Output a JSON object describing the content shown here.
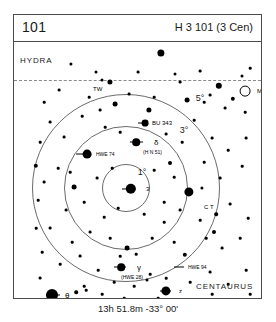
{
  "header": {
    "number": "101",
    "designation": "H 3 101 (3 Cen)"
  },
  "caption": "13h 51.8m  -33° 00'",
  "constellations": [
    {
      "name": "HYDRA",
      "x": 6,
      "y": 14
    },
    {
      "name": "CENTAURUS",
      "x": 182,
      "y": 240
    }
  ],
  "rings": [
    {
      "label": "5°",
      "radius": 94,
      "label_x": 186,
      "label_y": 56
    },
    {
      "label": "3°",
      "radius": 62,
      "label_x": 170,
      "label_y": 88
    },
    {
      "label": "1°",
      "radius": 24,
      "label_x": 128,
      "label_y": 130
    }
  ],
  "ring_center": {
    "x": 112,
    "y": 146
  },
  "labels": [
    {
      "text": "TW",
      "x": 79,
      "y": 47,
      "style": "obj-label"
    },
    {
      "text": "M83",
      "x": 243,
      "y": 49,
      "style": "obj-label"
    },
    {
      "text": "BU 343",
      "x": 138,
      "y": 81,
      "style": "obj-label"
    },
    {
      "text": "δ",
      "x": 140,
      "y": 100,
      "style": "obj-label greek"
    },
    {
      "text": "(H N 51)",
      "x": 129,
      "y": 110,
      "style": "obj-label sub"
    },
    {
      "text": "HWE 74",
      "x": 82,
      "y": 112,
      "style": "obj-label sub"
    },
    {
      "text": "3",
      "x": 132,
      "y": 147,
      "style": "obj-label"
    },
    {
      "text": "C T",
      "x": 190,
      "y": 165,
      "style": "obj-label"
    },
    {
      "text": "γ",
      "x": 123,
      "y": 225,
      "style": "obj-label greek"
    },
    {
      "text": "(HWE 28)",
      "x": 107,
      "y": 235,
      "style": "obj-label sub"
    },
    {
      "text": "HWE 94",
      "x": 174,
      "y": 225,
      "style": "obj-label sub"
    },
    {
      "text": "z",
      "x": 165,
      "y": 249,
      "style": "obj-label"
    },
    {
      "text": "θ",
      "x": 51,
      "y": 253,
      "style": "obj-label greek"
    },
    {
      "text": "RT",
      "x": 125,
      "y": 262,
      "style": "obj-label sub"
    }
  ],
  "ticks": [
    {
      "x": 108,
      "y": 147,
      "w": 14
    },
    {
      "x": 116,
      "y": 100,
      "w": 13
    },
    {
      "x": 62,
      "y": 112,
      "w": 11
    },
    {
      "x": 100,
      "y": 225,
      "w": 12
    },
    {
      "x": 160,
      "y": 225,
      "w": 10
    },
    {
      "x": 146,
      "y": 249,
      "w": 11
    },
    {
      "x": 32,
      "y": 253,
      "w": 14
    },
    {
      "x": 115,
      "y": 262,
      "w": 6
    },
    {
      "x": 124,
      "y": 81,
      "w": 8
    }
  ],
  "stars": [
    {
      "x": 117,
      "y": 147,
      "r": 5.2
    },
    {
      "x": 38,
      "y": 253,
      "r": 6.0
    },
    {
      "x": 152,
      "y": 249,
      "r": 4.6
    },
    {
      "x": 107,
      "y": 225,
      "r": 3.8
    },
    {
      "x": 122,
      "y": 100,
      "r": 3.8
    },
    {
      "x": 73,
      "y": 112,
      "r": 4.4
    },
    {
      "x": 131,
      "y": 81,
      "r": 3.4
    },
    {
      "x": 175,
      "y": 150,
      "r": 4.6
    },
    {
      "x": 147,
      "y": 11,
      "r": 3.6
    },
    {
      "x": 205,
      "y": 44,
      "r": 3.2
    },
    {
      "x": 96,
      "y": 40,
      "r": 2.6
    },
    {
      "x": 135,
      "y": 68,
      "r": 2.6
    },
    {
      "x": 101,
      "y": 62,
      "r": 2.4
    },
    {
      "x": 173,
      "y": 58,
      "r": 2.4
    },
    {
      "x": 219,
      "y": 57,
      "r": 2.2
    },
    {
      "x": 113,
      "y": 206,
      "r": 2.4
    },
    {
      "x": 171,
      "y": 213,
      "r": 2.2
    },
    {
      "x": 60,
      "y": 145,
      "r": 2.4
    },
    {
      "x": 156,
      "y": 121,
      "r": 2.0
    },
    {
      "x": 200,
      "y": 190,
      "r": 2.0
    },
    {
      "x": 57,
      "y": 22,
      "r": 1.6
    },
    {
      "x": 82,
      "y": 30,
      "r": 1.5
    },
    {
      "x": 88,
      "y": 38,
      "r": 1.5
    },
    {
      "x": 124,
      "y": 30,
      "r": 1.4
    },
    {
      "x": 161,
      "y": 32,
      "r": 1.5
    },
    {
      "x": 166,
      "y": 40,
      "r": 1.4
    },
    {
      "x": 186,
      "y": 29,
      "r": 1.4
    },
    {
      "x": 228,
      "y": 34,
      "r": 1.5
    },
    {
      "x": 236,
      "y": 26,
      "r": 1.3
    },
    {
      "x": 196,
      "y": 53,
      "r": 1.4
    },
    {
      "x": 190,
      "y": 60,
      "r": 1.3
    },
    {
      "x": 211,
      "y": 66,
      "r": 1.4
    },
    {
      "x": 231,
      "y": 70,
      "r": 1.3
    },
    {
      "x": 140,
      "y": 55,
      "r": 1.3
    },
    {
      "x": 115,
      "y": 52,
      "r": 1.4
    },
    {
      "x": 75,
      "y": 55,
      "r": 1.3
    },
    {
      "x": 45,
      "y": 48,
      "r": 1.4
    },
    {
      "x": 30,
      "y": 60,
      "r": 1.3
    },
    {
      "x": 36,
      "y": 80,
      "r": 1.4
    },
    {
      "x": 26,
      "y": 100,
      "r": 1.3
    },
    {
      "x": 50,
      "y": 95,
      "r": 1.4
    },
    {
      "x": 68,
      "y": 74,
      "r": 1.3
    },
    {
      "x": 86,
      "y": 68,
      "r": 1.4
    },
    {
      "x": 91,
      "y": 85,
      "r": 1.3
    },
    {
      "x": 106,
      "y": 90,
      "r": 1.3
    },
    {
      "x": 152,
      "y": 92,
      "r": 1.4
    },
    {
      "x": 168,
      "y": 100,
      "r": 1.3
    },
    {
      "x": 180,
      "y": 78,
      "r": 1.3
    },
    {
      "x": 198,
      "y": 96,
      "r": 1.4
    },
    {
      "x": 214,
      "y": 108,
      "r": 1.3
    },
    {
      "x": 232,
      "y": 96,
      "r": 1.4
    },
    {
      "x": 228,
      "y": 124,
      "r": 1.3
    },
    {
      "x": 206,
      "y": 136,
      "r": 1.4
    },
    {
      "x": 190,
      "y": 120,
      "r": 1.3
    },
    {
      "x": 160,
      "y": 135,
      "r": 1.3
    },
    {
      "x": 140,
      "y": 128,
      "r": 1.3
    },
    {
      "x": 98,
      "y": 126,
      "r": 1.3
    },
    {
      "x": 83,
      "y": 136,
      "r": 1.4
    },
    {
      "x": 44,
      "y": 126,
      "r": 1.3
    },
    {
      "x": 30,
      "y": 140,
      "r": 1.4
    },
    {
      "x": 24,
      "y": 158,
      "r": 1.3
    },
    {
      "x": 52,
      "y": 168,
      "r": 1.4
    },
    {
      "x": 70,
      "y": 160,
      "r": 1.3
    },
    {
      "x": 90,
      "y": 175,
      "r": 1.3
    },
    {
      "x": 104,
      "y": 166,
      "r": 1.3
    },
    {
      "x": 130,
      "y": 172,
      "r": 1.3
    },
    {
      "x": 150,
      "y": 180,
      "r": 1.3
    },
    {
      "x": 166,
      "y": 168,
      "r": 1.4
    },
    {
      "x": 186,
      "y": 178,
      "r": 1.3
    },
    {
      "x": 216,
      "y": 162,
      "r": 1.4
    },
    {
      "x": 234,
      "y": 176,
      "r": 1.3
    },
    {
      "x": 226,
      "y": 196,
      "r": 1.3
    },
    {
      "x": 208,
      "y": 206,
      "r": 1.4
    },
    {
      "x": 192,
      "y": 196,
      "r": 1.3
    },
    {
      "x": 160,
      "y": 200,
      "r": 1.3
    },
    {
      "x": 138,
      "y": 196,
      "r": 1.3
    },
    {
      "x": 122,
      "y": 212,
      "r": 1.3
    },
    {
      "x": 96,
      "y": 196,
      "r": 1.3
    },
    {
      "x": 76,
      "y": 190,
      "r": 1.4
    },
    {
      "x": 58,
      "y": 200,
      "r": 1.3
    },
    {
      "x": 36,
      "y": 186,
      "r": 1.4
    },
    {
      "x": 28,
      "y": 210,
      "r": 1.3
    },
    {
      "x": 46,
      "y": 222,
      "r": 1.3
    },
    {
      "x": 66,
      "y": 214,
      "r": 1.4
    },
    {
      "x": 84,
      "y": 228,
      "r": 1.3
    },
    {
      "x": 100,
      "y": 240,
      "r": 1.3
    },
    {
      "x": 120,
      "y": 244,
      "r": 1.3
    },
    {
      "x": 136,
      "y": 232,
      "r": 1.3
    },
    {
      "x": 152,
      "y": 236,
      "r": 1.3
    },
    {
      "x": 176,
      "y": 240,
      "r": 1.3
    },
    {
      "x": 196,
      "y": 230,
      "r": 1.4
    },
    {
      "x": 214,
      "y": 242,
      "r": 1.3
    },
    {
      "x": 232,
      "y": 228,
      "r": 1.3
    },
    {
      "x": 236,
      "y": 252,
      "r": 1.3
    },
    {
      "x": 218,
      "y": 258,
      "r": 1.3
    },
    {
      "x": 198,
      "y": 252,
      "r": 1.3
    },
    {
      "x": 180,
      "y": 260,
      "r": 1.4
    },
    {
      "x": 162,
      "y": 262,
      "r": 1.3
    },
    {
      "x": 144,
      "y": 256,
      "r": 1.3
    },
    {
      "x": 110,
      "y": 256,
      "r": 1.3
    },
    {
      "x": 88,
      "y": 252,
      "r": 1.3
    },
    {
      "x": 70,
      "y": 244,
      "r": 1.3
    },
    {
      "x": 62,
      "y": 260,
      "r": 1.3
    },
    {
      "x": 26,
      "y": 236,
      "r": 1.4
    },
    {
      "x": 22,
      "y": 186,
      "r": 1.3
    },
    {
      "x": 62,
      "y": 250,
      "r": 1.8
    },
    {
      "x": 72,
      "y": 248,
      "r": 1.3
    },
    {
      "x": 22,
      "y": 124,
      "r": 2.2
    },
    {
      "x": 56,
      "y": 130,
      "r": 1.3
    },
    {
      "x": 133,
      "y": 238,
      "r": 1.5
    },
    {
      "x": 106,
      "y": 214,
      "r": 1.3
    },
    {
      "x": 188,
      "y": 146,
      "r": 1.6
    },
    {
      "x": 150,
      "y": 160,
      "r": 1.3
    },
    {
      "x": 202,
      "y": 172,
      "r": 1.8
    }
  ],
  "open_objects": [
    {
      "x": 231,
      "y": 49,
      "r": 5.4,
      "name": "M83"
    }
  ]
}
